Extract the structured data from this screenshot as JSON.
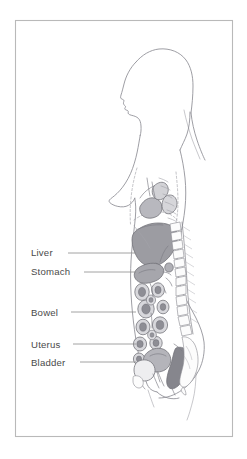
{
  "figure": {
    "orientation": "left-facing profile",
    "frame": {
      "x": 15,
      "y": 20,
      "width": 218,
      "height": 417,
      "stroke_color": "#b9b9b9"
    },
    "background_color": "#ffffff"
  },
  "labels": [
    {
      "id": "liver",
      "text": "Liver",
      "text_x": 31,
      "text_y": 256,
      "line_start_x": 68,
      "line_start_y": 253,
      "line_end_x": 136,
      "line_end_y": 253
    },
    {
      "id": "stomach",
      "text": "Stomach",
      "text_x": 31,
      "text_y": 275,
      "line_start_x": 84,
      "line_start_y": 272,
      "line_end_x": 136,
      "line_end_y": 272
    },
    {
      "id": "bowel",
      "text": "Bowel",
      "text_x": 31,
      "text_y": 316,
      "line_start_x": 71,
      "line_start_y": 312,
      "line_end_x": 136,
      "line_end_y": 312
    },
    {
      "id": "uterus",
      "text": "Uterus",
      "text_x": 31,
      "text_y": 348,
      "line_start_x": 73,
      "line_start_y": 344,
      "line_end_x": 136,
      "line_end_y": 344
    },
    {
      "id": "bladder",
      "text": "Bladder",
      "text_x": 31,
      "text_y": 366,
      "line_start_x": 80,
      "line_start_y": 362,
      "line_end_x": 136,
      "line_end_y": 362
    }
  ],
  "colors": {
    "outline": "#8d8d93",
    "organ_shade": "#9a9aa0",
    "organ_light": "#c4c4c9",
    "organ_dark": "#7a7a81",
    "text": "#4a4a4a",
    "leader": "#8a8a8a",
    "bone": "#fcfcfc"
  },
  "anatomy_parts": [
    "head-profile",
    "hair",
    "neck",
    "breast",
    "liver",
    "stomach",
    "heart",
    "lung",
    "diaphragm",
    "bowel-loops",
    "uterus",
    "bladder",
    "rectum",
    "vertebral-column",
    "sacrum",
    "thigh"
  ]
}
